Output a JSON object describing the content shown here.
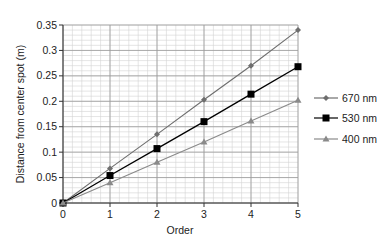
{
  "chart_data": {
    "type": "line",
    "title": "",
    "xlabel": "Order",
    "ylabel": "Distance from center spot (m)",
    "x": [
      0,
      1,
      2,
      3,
      4,
      5
    ],
    "xlim": [
      0,
      5
    ],
    "ylim": [
      0,
      0.35
    ],
    "xticks": [
      "0",
      "1",
      "2",
      "3",
      "4",
      "5"
    ],
    "yticks": [
      "0",
      "0.05",
      "0.1",
      "0.15",
      "0.2",
      "0.25",
      "0.3",
      "0.35"
    ],
    "grid": true,
    "legend_position": "right",
    "series": [
      {
        "name": "670 nm",
        "marker": "diamond",
        "color": "#6e6e6e",
        "values": [
          0,
          0.068,
          0.135,
          0.203,
          0.27,
          0.34
        ]
      },
      {
        "name": "530 nm",
        "marker": "square",
        "color": "#000000",
        "values": [
          0,
          0.054,
          0.107,
          0.16,
          0.214,
          0.268
        ]
      },
      {
        "name": "400 nm",
        "marker": "triangle",
        "color": "#8a8a8a",
        "values": [
          0,
          0.04,
          0.08,
          0.12,
          0.161,
          0.202
        ]
      }
    ]
  },
  "legend": {
    "items": [
      "670 nm",
      "530 nm",
      "400 nm"
    ]
  }
}
